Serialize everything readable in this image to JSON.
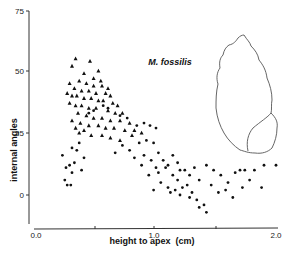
{
  "chart_data": {
    "type": "scatter",
    "title": "",
    "annotation": "M. fossilis",
    "xlabel": "height to apex  (cm)",
    "ylabel": "internal angles",
    "xlim": [
      0.0,
      2.0
    ],
    "ylim": [
      -10,
      75
    ],
    "x_ticks": [
      "0.0",
      "1.0",
      "2.0"
    ],
    "y_ticks": [
      "0",
      "25",
      "50",
      "75"
    ],
    "grid": false,
    "legend": "none",
    "series": [
      {
        "name": "triangles",
        "marker": "triangle",
        "points": [
          [
            0.33,
            55
          ],
          [
            0.3,
            52
          ],
          [
            0.45,
            54
          ],
          [
            0.4,
            49
          ],
          [
            0.48,
            47
          ],
          [
            0.52,
            50
          ],
          [
            0.36,
            46
          ],
          [
            0.42,
            45
          ],
          [
            0.55,
            44
          ],
          [
            0.28,
            45
          ],
          [
            0.32,
            43
          ],
          [
            0.38,
            42
          ],
          [
            0.44,
            42
          ],
          [
            0.5,
            41
          ],
          [
            0.58,
            41
          ],
          [
            0.62,
            40
          ],
          [
            0.26,
            41
          ],
          [
            0.3,
            40
          ],
          [
            0.34,
            40
          ],
          [
            0.4,
            39
          ],
          [
            0.46,
            39
          ],
          [
            0.52,
            38
          ],
          [
            0.56,
            38
          ],
          [
            0.64,
            37
          ],
          [
            0.68,
            36
          ],
          [
            0.28,
            37
          ],
          [
            0.33,
            36
          ],
          [
            0.38,
            36
          ],
          [
            0.44,
            35
          ],
          [
            0.5,
            35
          ],
          [
            0.6,
            34
          ],
          [
            0.66,
            33
          ],
          [
            0.72,
            33
          ],
          [
            0.35,
            33
          ],
          [
            0.42,
            32
          ],
          [
            0.48,
            31
          ],
          [
            0.55,
            31
          ],
          [
            0.62,
            30
          ],
          [
            0.7,
            30
          ],
          [
            0.78,
            29
          ],
          [
            0.3,
            30
          ],
          [
            0.37,
            29
          ],
          [
            0.44,
            28
          ],
          [
            0.52,
            28
          ],
          [
            0.58,
            27
          ],
          [
            0.65,
            27
          ],
          [
            0.74,
            26
          ],
          [
            0.82,
            26
          ],
          [
            0.36,
            25
          ],
          [
            0.46,
            24
          ],
          [
            0.55,
            24
          ],
          [
            0.62,
            23
          ],
          [
            0.7,
            22
          ],
          [
            0.8,
            24
          ],
          [
            0.88,
            25
          ],
          [
            0.33,
            27
          ],
          [
            0.4,
            26
          ],
          [
            0.48,
            44
          ],
          [
            0.54,
            46
          ],
          [
            0.6,
            43
          ]
        ]
      },
      {
        "name": "dots",
        "marker": "circle",
        "points": [
          [
            0.22,
            16
          ],
          [
            0.25,
            11
          ],
          [
            0.28,
            12
          ],
          [
            0.3,
            19
          ],
          [
            0.32,
            13
          ],
          [
            0.34,
            18
          ],
          [
            0.36,
            21
          ],
          [
            0.3,
            9
          ],
          [
            0.24,
            6
          ],
          [
            0.26,
            4
          ],
          [
            0.29,
            4
          ],
          [
            0.38,
            10
          ],
          [
            0.4,
            15
          ],
          [
            0.44,
            33
          ],
          [
            0.48,
            34
          ],
          [
            0.56,
            36
          ],
          [
            0.6,
            35
          ],
          [
            0.7,
            32
          ],
          [
            0.76,
            31
          ],
          [
            0.84,
            28
          ],
          [
            0.9,
            29
          ],
          [
            0.95,
            28
          ],
          [
            1.0,
            27
          ],
          [
            0.92,
            22
          ],
          [
            0.98,
            21
          ],
          [
            0.86,
            21
          ],
          [
            0.78,
            18
          ],
          [
            0.72,
            20
          ],
          [
            0.66,
            17
          ],
          [
            0.82,
            15
          ],
          [
            0.9,
            16
          ],
          [
            0.96,
            14
          ],
          [
            1.02,
            17
          ],
          [
            1.06,
            14
          ],
          [
            1.1,
            12
          ],
          [
            1.14,
            16
          ],
          [
            1.18,
            13
          ],
          [
            1.2,
            10
          ],
          [
            1.02,
            9
          ],
          [
            1.08,
            11
          ],
          [
            1.14,
            8
          ],
          [
            1.18,
            6
          ],
          [
            1.24,
            10
          ],
          [
            1.28,
            8
          ],
          [
            1.32,
            11
          ],
          [
            1.36,
            6
          ],
          [
            1.04,
            5
          ],
          [
            1.1,
            3
          ],
          [
            1.16,
            2
          ],
          [
            1.22,
            3
          ],
          [
            1.26,
            4
          ],
          [
            1.3,
            1
          ],
          [
            1.34,
            -2
          ],
          [
            1.4,
            -4
          ],
          [
            1.42,
            -7
          ],
          [
            1.36,
            -5
          ],
          [
            1.28,
            -1
          ],
          [
            1.2,
            0
          ],
          [
            1.12,
            1
          ],
          [
            0.98,
            2
          ],
          [
            1.42,
            12
          ],
          [
            1.48,
            10
          ],
          [
            1.54,
            8
          ],
          [
            1.6,
            5
          ],
          [
            1.66,
            9
          ],
          [
            1.7,
            10
          ],
          [
            1.74,
            10
          ],
          [
            1.78,
            6
          ],
          [
            1.82,
            10
          ],
          [
            1.88,
            3
          ],
          [
            1.46,
            4
          ],
          [
            1.52,
            1
          ],
          [
            1.58,
            2
          ],
          [
            1.64,
            -1
          ],
          [
            1.72,
            3
          ],
          [
            1.9,
            12
          ],
          [
            2.0,
            12
          ],
          [
            1.0,
            11
          ],
          [
            0.94,
            8
          ],
          [
            0.88,
            12
          ]
        ]
      }
    ]
  },
  "labels": {
    "annotation": "M. fossilis",
    "xlabel": "height to apex  (cm)",
    "ylabel": "internal angles",
    "x_ticks": [
      "0.0",
      "1.0",
      "2.0"
    ],
    "y_ticks": [
      "0",
      "25",
      "50",
      "75"
    ]
  }
}
